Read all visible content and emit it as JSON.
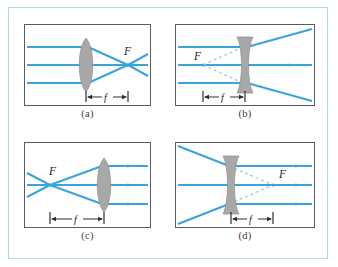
{
  "figure": {
    "frame_color": "#aedde8",
    "panel_border_color": "#595b5e",
    "ray_color": "#3aa3dc",
    "virtual_ray_color": "#9fcfe2",
    "lens_fill_color": "#a8a8a8",
    "background_color": "#ffffff"
  },
  "panels": [
    {
      "id": "a",
      "caption": "(a)",
      "lens_type": "converging",
      "lens_shape": "biconvex",
      "focal_label": "F",
      "focal_side": "right",
      "focal_is_virtual": false,
      "dimension_label": "f",
      "incoming_rays": "parallel",
      "outgoing_rays": "converging-to-focus",
      "ray_count": 3
    },
    {
      "id": "b",
      "caption": "(b)",
      "lens_type": "diverging",
      "lens_shape": "biconcave",
      "focal_label": "F",
      "focal_side": "left",
      "focal_is_virtual": true,
      "dimension_label": "f",
      "incoming_rays": "parallel",
      "outgoing_rays": "diverging",
      "ray_count": 3
    },
    {
      "id": "c",
      "caption": "(c)",
      "lens_type": "converging",
      "lens_shape": "biconvex",
      "focal_label": "F",
      "focal_side": "left",
      "focal_is_virtual": false,
      "dimension_label": "f",
      "incoming_rays": "diverging-from-focus",
      "outgoing_rays": "parallel",
      "ray_count": 3
    },
    {
      "id": "d",
      "caption": "(d)",
      "lens_type": "diverging",
      "lens_shape": "biconcave",
      "focal_label": "F",
      "focal_side": "right",
      "focal_is_virtual": true,
      "dimension_label": "f",
      "incoming_rays": "converging",
      "outgoing_rays": "parallel",
      "ray_count": 3
    }
  ]
}
